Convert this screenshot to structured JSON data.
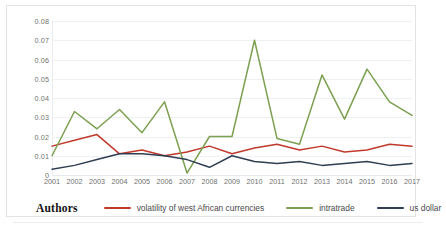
{
  "figure": {
    "legend_title": "Authors"
  },
  "chart_data": {
    "type": "line",
    "title": "",
    "xlabel": "",
    "ylabel": "",
    "categories": [
      "2001",
      "2002",
      "2003",
      "2004",
      "2005",
      "2006",
      "2007",
      "2008",
      "2009",
      "2010",
      "2011",
      "2012",
      "2013",
      "2014",
      "2015",
      "2016",
      "2017"
    ],
    "ylim": [
      0,
      0.08
    ],
    "ytick_labels": [
      "0.08",
      "0.07",
      "0.06",
      "0.05",
      "0.04",
      "0.03",
      "0.02",
      "0.01",
      "0"
    ],
    "ytick_values": [
      0.08,
      0.07,
      0.06,
      0.05,
      0.04,
      0.03,
      0.02,
      0.01,
      0
    ],
    "grid": "horizontal",
    "legend_position": "bottom",
    "series": [
      {
        "name": "volatility of west African currencies",
        "color": "#C0392B",
        "values": [
          0.015,
          0.018,
          0.021,
          0.011,
          0.013,
          0.01,
          0.012,
          0.015,
          0.011,
          0.014,
          0.016,
          0.013,
          0.015,
          0.012,
          0.013,
          0.016,
          0.015
        ]
      },
      {
        "name": "intratrade",
        "color": "#7CA050",
        "values": [
          0.01,
          0.033,
          0.024,
          0.034,
          0.022,
          0.038,
          0.001,
          0.02,
          0.02,
          0.07,
          0.019,
          0.016,
          0.052,
          0.029,
          0.055,
          0.038,
          0.031
        ]
      },
      {
        "name": "us dollar",
        "color": "#2F3E50",
        "values": [
          0.003,
          0.005,
          0.008,
          0.011,
          0.011,
          0.01,
          0.008,
          0.004,
          0.01,
          0.007,
          0.006,
          0.007,
          0.005,
          0.006,
          0.007,
          0.005,
          0.006
        ]
      }
    ]
  }
}
